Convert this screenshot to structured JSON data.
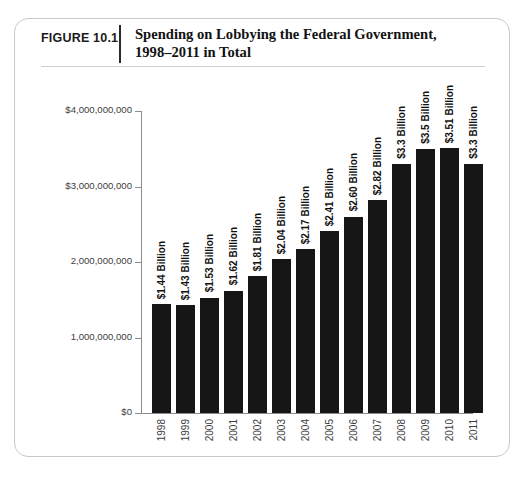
{
  "figure": {
    "number": "FIGURE 10.1",
    "title_line1": "Spending on Lobbying the Federal Government,",
    "title_line2": "1998–2011 in Total"
  },
  "colors": {
    "bar": "#161616",
    "axis": "#8c8c8c",
    "frame": "#c9c9c9",
    "text": "#111111",
    "tick_text": "#3d3d3d"
  },
  "chart_data": {
    "type": "bar",
    "title": "Spending on Lobbying the Federal Government, 1998–2011 in Total",
    "xlabel": "",
    "ylabel": "",
    "ylim": [
      0,
      4000000000
    ],
    "grid": false,
    "legend": null,
    "categories": [
      "1998",
      "1999",
      "2000",
      "2001",
      "2002",
      "2003",
      "2004",
      "2005",
      "2006",
      "2007",
      "2008",
      "2009",
      "2010",
      "2011"
    ],
    "values": [
      1440000000,
      1430000000,
      1530000000,
      1620000000,
      1810000000,
      2040000000,
      2170000000,
      2410000000,
      2600000000,
      2820000000,
      3300000000,
      3500000000,
      3510000000,
      3300000000
    ],
    "data_labels": [
      "$1.44 Billion",
      "$1.43 Billion",
      "$1.53 Billion",
      "$1.62 Billion",
      "$1.81 Billion",
      "$2.04 Billion",
      "$2.17 Billion",
      "$2.41 Billion",
      "$2.60 Billion",
      "$2.82 Billion",
      "$3.3 Billion",
      "$3.5 Billion",
      "$3.51 Billion",
      "$3.3 Billion"
    ],
    "ytick_values": [
      0,
      1000000000,
      2000000000,
      3000000000,
      4000000000
    ],
    "ytick_labels": [
      "$0",
      "1,000,000,000",
      "2,000,000,000",
      "$3,000,000,000",
      "$4,000,000,000"
    ]
  }
}
